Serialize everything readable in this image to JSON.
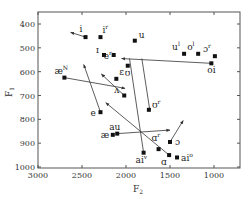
{
  "chart_data": {
    "type": "scatter",
    "title": "",
    "xlabel": "F2",
    "ylabel": "F1",
    "xlim": [
      3000,
      750
    ],
    "ylim": [
      1050,
      320
    ],
    "x_reversed": true,
    "y_reversed": true,
    "xticks": [
      3000,
      2500,
      2000,
      1500,
      1000
    ],
    "yticks": [
      400,
      500,
      600,
      700,
      800,
      900,
      1000
    ],
    "grid": false,
    "points": [
      {
        "label": "i",
        "sup": "",
        "F2": 2460,
        "F1": 455
      },
      {
        "label": "i",
        "sup": "r",
        "F2": 2290,
        "F1": 455
      },
      {
        "label": "u",
        "sup": "",
        "F2": 1900,
        "F1": 470
      },
      {
        "label": "u",
        "sup": "l",
        "F2": 1340,
        "F1": 525
      },
      {
        "label": "o",
        "sup": "l",
        "F2": 1180,
        "F1": 525
      },
      {
        "label": "ɔ",
        "sup": "r",
        "F2": 990,
        "F1": 535
      },
      {
        "label": "oi",
        "sup": "",
        "F2": 1030,
        "F1": 565
      },
      {
        "label": "ɪ",
        "sup": "",
        "F2": 2250,
        "F1": 530
      },
      {
        "label": "e",
        "sup": "r",
        "F2": 2140,
        "F1": 530
      },
      {
        "label": "ʊ",
        "sup": "",
        "F2": 1980,
        "F1": 575
      },
      {
        "label": "æ",
        "sup": "N",
        "F2": 2700,
        "F1": 625
      },
      {
        "label": "ɛ",
        "sup": "",
        "F2": 2110,
        "F1": 630
      },
      {
        "label": "e",
        "sup": "",
        "F2": 2290,
        "F1": 770
      },
      {
        "label": "ʌ",
        "sup": "",
        "F2": 2020,
        "F1": 700
      },
      {
        "label": "ʊ",
        "sup": "r",
        "F2": 1740,
        "F1": 760
      },
      {
        "label": "au",
        "sup": "",
        "F2": 2100,
        "F1": 860
      },
      {
        "label": "æ",
        "sup": "",
        "F2": 2150,
        "F1": 865
      },
      {
        "label": "ɑ",
        "sup": "r",
        "F2": 1630,
        "F1": 925
      },
      {
        "label": "ɔ",
        "sup": "",
        "F2": 1500,
        "F1": 895
      },
      {
        "label": "ɑ",
        "sup": "",
        "F2": 1510,
        "F1": 950
      },
      {
        "label": "ai",
        "sup": "o",
        "F2": 1420,
        "F1": 960
      },
      {
        "label": "ai",
        "sup": "v",
        "F2": 1800,
        "F1": 940
      }
    ],
    "arrows": [
      {
        "from": "i",
        "from_xy": [
          2460,
          455
        ],
        "to_xy": [
          2630,
          435
        ]
      },
      {
        "from": "oi",
        "from_xy": [
          1030,
          565
        ],
        "to_xy": [
          2050,
          545
        ]
      },
      {
        "from": "æN",
        "from_xy": [
          2700,
          625
        ],
        "to_xy": [
          2010,
          670
        ]
      },
      {
        "from": "e",
        "from_xy": [
          2290,
          770
        ],
        "to_xy": [
          2480,
          570
        ]
      },
      {
        "from": "ʌ",
        "from_xy": [
          2020,
          700
        ],
        "to_xy": [
          2280,
          610
        ]
      },
      {
        "from": "au",
        "from_xy": [
          2100,
          860
        ],
        "to_xy": [
          1500,
          845
        ]
      },
      {
        "from": "ɑ",
        "from_xy": [
          1510,
          950
        ],
        "to_xy": [
          2230,
          730
        ]
      },
      {
        "from": "ɔ",
        "from_xy": [
          1500,
          895
        ],
        "to_xy": [
          1350,
          805
        ]
      }
    ],
    "lines": [
      {
        "from_xy": [
          1960,
          545
        ],
        "to_xy": [
          1800,
          940
        ]
      },
      {
        "from_xy": [
          1820,
          545
        ],
        "to_xy": [
          1730,
          760
        ]
      }
    ]
  },
  "axes": {
    "x_title": "F",
    "x_sub": "2",
    "y_title": "F",
    "y_sub": "1",
    "x_tick_labels": [
      "3000",
      "2500",
      "2000",
      "1500",
      "1000"
    ],
    "y_tick_labels": [
      "400",
      "500",
      "600",
      "700",
      "800",
      "900",
      "1000"
    ]
  },
  "colors": {
    "axis": "#555555",
    "marker": "#111111",
    "line": "#333333"
  }
}
